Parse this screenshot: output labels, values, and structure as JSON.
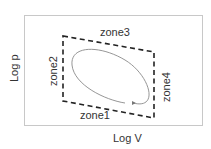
{
  "diagram": {
    "x_axis_label": "Log V",
    "y_axis_label": "Log p",
    "zones": [
      {
        "id": "zone1",
        "label": "zone1",
        "side": "bottom"
      },
      {
        "id": "zone2",
        "label": "zone2",
        "side": "left"
      },
      {
        "id": "zone3",
        "label": "zone3",
        "side": "top"
      },
      {
        "id": "zone4",
        "label": "zone4",
        "side": "right"
      }
    ],
    "cycle": {
      "shape": "ellipse",
      "direction": "clockwise-arrow"
    },
    "colors": {
      "frame": "#c8c8c8",
      "dashed": "#222222",
      "ellipse": "#8a8a8a",
      "text": "#333333"
    }
  }
}
